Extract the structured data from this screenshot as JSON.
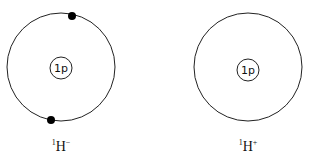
{
  "atoms": [
    {
      "label_mass": "1",
      "label_symbol": "H",
      "label_charge": "−",
      "nucleus_text": "1p",
      "electrons": 2
    },
    {
      "label_mass": "1",
      "label_symbol": "H",
      "label_charge": "+",
      "nucleus_text": "1p",
      "electrons": 0
    }
  ]
}
